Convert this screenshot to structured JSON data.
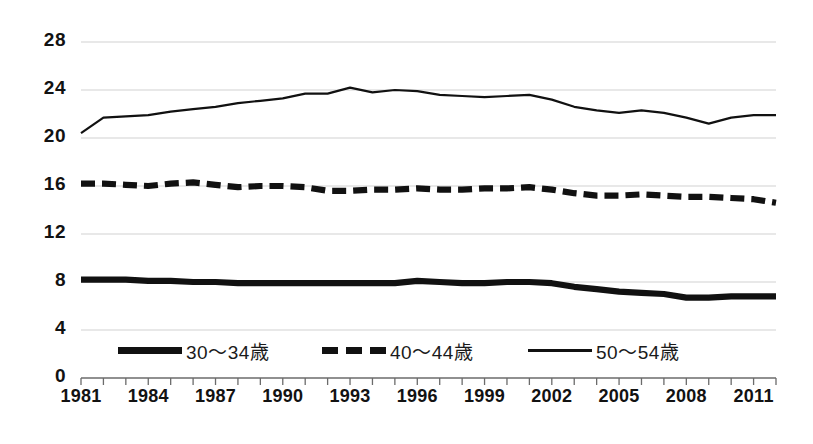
{
  "chart_data": {
    "type": "line",
    "title": "",
    "subtitle": "",
    "xlabel": "",
    "ylabel": "",
    "grid": true,
    "legend_position": "bottom-inside",
    "xlim": [
      1981,
      2012
    ],
    "ylim": [
      0,
      28
    ],
    "ytick_step": 4,
    "y_ticks": [
      "0",
      "4",
      "8",
      "12",
      "16",
      "20",
      "24",
      "28"
    ],
    "x_tick_labels": [
      "1981",
      "1984",
      "1987",
      "1990",
      "1993",
      "1996",
      "1999",
      "2002",
      "2005",
      "2008",
      "2011"
    ],
    "x": [
      1981,
      1982,
      1983,
      1984,
      1985,
      1986,
      1987,
      1988,
      1989,
      1990,
      1991,
      1992,
      1993,
      1994,
      1995,
      1996,
      1997,
      1998,
      1999,
      2000,
      2001,
      2002,
      2003,
      2004,
      2005,
      2006,
      2007,
      2008,
      2009,
      2010,
      2011,
      2012
    ],
    "series": [
      {
        "name": "30〜34歳",
        "style": "thick-solid",
        "color": "#111111",
        "values": [
          8.2,
          8.2,
          8.2,
          8.1,
          8.1,
          8.0,
          8.0,
          7.9,
          7.9,
          7.9,
          7.9,
          7.9,
          7.9,
          7.9,
          7.9,
          8.1,
          8.0,
          7.9,
          7.9,
          8.0,
          8.0,
          7.9,
          7.6,
          7.4,
          7.2,
          7.1,
          7.0,
          6.7,
          6.7,
          6.8,
          6.8,
          6.8
        ]
      },
      {
        "name": "40〜44歳",
        "style": "dashed",
        "color": "#111111",
        "values": [
          16.2,
          16.2,
          16.1,
          16.0,
          16.2,
          16.3,
          16.1,
          15.9,
          16.0,
          16.0,
          15.9,
          15.6,
          15.6,
          15.7,
          15.7,
          15.8,
          15.7,
          15.7,
          15.8,
          15.8,
          15.9,
          15.7,
          15.4,
          15.2,
          15.2,
          15.3,
          15.2,
          15.1,
          15.1,
          15.0,
          14.9,
          14.6
        ]
      },
      {
        "name": "50〜54歳",
        "style": "thin-solid",
        "color": "#111111",
        "values": [
          20.4,
          21.7,
          21.8,
          21.9,
          22.2,
          22.4,
          22.6,
          22.9,
          23.1,
          23.3,
          23.7,
          23.7,
          24.2,
          23.8,
          24.0,
          23.9,
          23.6,
          23.5,
          23.4,
          23.5,
          23.6,
          23.2,
          22.6,
          22.3,
          22.1,
          22.3,
          22.1,
          21.7,
          21.2,
          21.7,
          21.9,
          21.9
        ]
      }
    ]
  }
}
